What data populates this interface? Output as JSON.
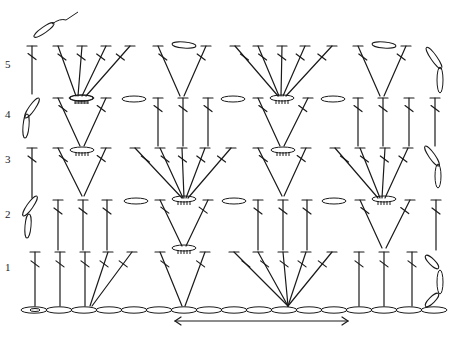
{
  "diagram": {
    "type": "crochet-stitch-chart",
    "row_labels": [
      "1",
      "2",
      "3",
      "4",
      "5"
    ],
    "rows": [
      {
        "label": "1",
        "groups": [
          "dc",
          "dc",
          "dc",
          "fan3",
          "fan2-v",
          "fan5",
          "dc",
          "dc",
          "dc",
          "turn-ch"
        ]
      },
      {
        "label": "2",
        "groups": [
          "turn-ch",
          "dc",
          "dc",
          "dc",
          "ch",
          "v",
          "ch",
          "dc",
          "dc",
          "dc",
          "ch",
          "v",
          "dc"
        ]
      },
      {
        "label": "3",
        "groups": [
          "dc",
          "v",
          "fan5",
          "v",
          "fan4",
          "turn-ch"
        ]
      },
      {
        "label": "4",
        "groups": [
          "turn-ch",
          "v",
          "ch",
          "dc",
          "dc",
          "dc",
          "ch",
          "v",
          "ch",
          "dc",
          "dc",
          "dc",
          "dc"
        ]
      },
      {
        "label": "5",
        "groups": [
          "dc",
          "fan5",
          "v",
          "fan5",
          "v",
          "turn-ch"
        ]
      }
    ],
    "foundation": "chain",
    "repeat_indicator": "double-arrow",
    "ink_color": "#1a1a1a",
    "background": "#ffffff"
  }
}
